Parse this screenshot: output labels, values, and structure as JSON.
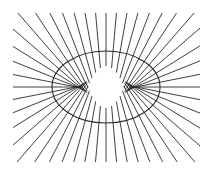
{
  "figure": {
    "title": "",
    "background": "#ffffff",
    "stroke_color": "#2a2a2a",
    "ellipse": {
      "cx": 106,
      "cy": 87,
      "rx": 54,
      "ry": 36
    },
    "clip_box": {
      "x0": 13,
      "y0": 13,
      "x1": 200,
      "y1": 162
    },
    "normal_count": 48,
    "line_width": 0.9,
    "ellipse_width": 1.1
  }
}
